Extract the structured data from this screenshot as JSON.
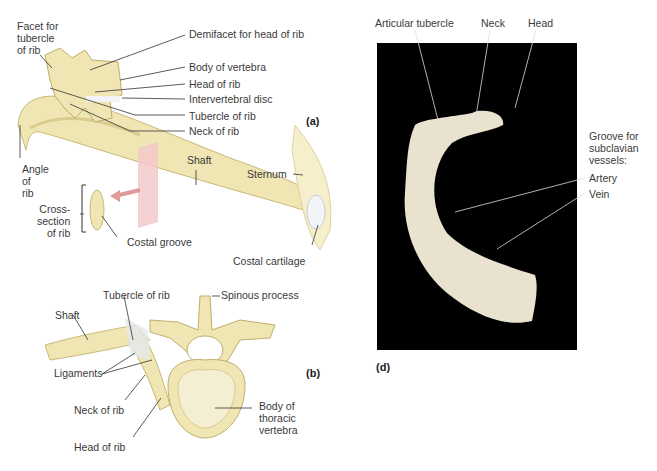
{
  "figure": {
    "panels": {
      "a": {
        "tag": "(a)",
        "labels": {
          "facet_tubercle": "Facet for\ntubercle\nof rib",
          "demifacet": "Demifacet for head of rib",
          "body_vertebra": "Body of vertebra",
          "head_rib": "Head of rib",
          "intervertebral_disc": "Intervertebral disc",
          "tubercle_rib": "Tubercle of rib",
          "neck_rib": "Neck of rib",
          "angle_rib": "Angle\nof\nrib",
          "shaft": "Shaft",
          "sternum": "Sternum",
          "cross_section": "Cross-\nsection\nof rib",
          "costal_groove": "Costal groove",
          "costal_cartilage": "Costal cartilage"
        }
      },
      "b": {
        "tag": "(b)",
        "labels": {
          "tubercle_rib": "Tubercle of rib",
          "spinous_process": "Spinous process",
          "shaft": "Shaft",
          "ligaments": "Ligaments",
          "neck_rib": "Neck of rib",
          "head_rib": "Head of rib",
          "body_thoracic": "Body of\nthoracic\nvertebra"
        }
      },
      "d": {
        "tag": "(d)",
        "labels": {
          "articular_tubercle": "Articular tubercle",
          "neck": "Neck",
          "head": "Head",
          "groove": "Groove for\nsubclavian\nvessels:",
          "artery": "Artery",
          "vein": "Vein"
        }
      }
    },
    "colors": {
      "bone": "#efe6b4",
      "bone_shade": "#d9cc8c",
      "cartilage": "#f2f4f8",
      "plane": "#f4c9c9",
      "photo_bg": "#000000",
      "photo_bone": "#e8e2cf",
      "leader": "#333333"
    }
  }
}
